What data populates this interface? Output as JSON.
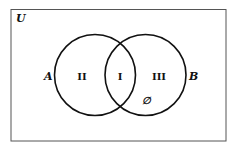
{
  "diagram": {
    "type": "venn",
    "universe_label": "U",
    "sets": [
      {
        "name": "A",
        "region_label": "II"
      },
      {
        "name": "B",
        "region_label": "III"
      }
    ],
    "intersection_label": "I",
    "empty_set_marker": "∅",
    "colors": {
      "stroke": "#111111",
      "border": "#555555",
      "background": "#ffffff"
    }
  }
}
